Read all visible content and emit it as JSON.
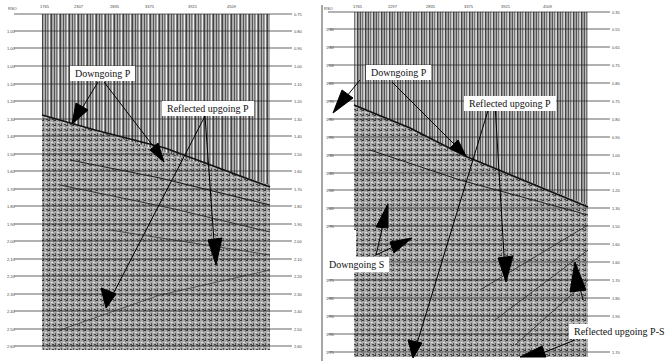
{
  "figure": {
    "panels": [
      {
        "id": "left",
        "axis_label": "RSO",
        "top_ticks": [
          "1765",
          "2307",
          "2835",
          "3375",
          "3921",
          "4509"
        ],
        "left_ticks": [
          "",
          "1.00",
          "1.00",
          "1.00",
          "1.10",
          "1.20",
          "1.30",
          "1.40",
          "1.50",
          "1.60",
          "1.70",
          "1.80",
          "1.90",
          "2.00",
          "2.10",
          "2.20",
          "2.30",
          "2.40",
          "2.50",
          "2.60"
        ],
        "right_ticks": [
          "0.75",
          "0.80",
          "0.90",
          "1.00",
          "1.10",
          "1.20",
          "1.30",
          "1.40",
          "1.50",
          "1.60",
          "1.70",
          "1.80",
          "1.90",
          "2.00",
          "2.10",
          "2.20",
          "2.30",
          "2.40",
          "2.50",
          "2.60"
        ],
        "callouts": [
          {
            "text": "Downgoing P"
          },
          {
            "text": "Reflected upgoing P"
          }
        ]
      },
      {
        "id": "right",
        "axis_label": "RSO",
        "top_ticks": [
          "1765",
          "2297",
          "2835",
          "3375",
          "3921",
          "4509"
        ],
        "left_ticks": [
          "",
          "1.30",
          "1.40",
          "1.50",
          "1.60",
          "1.70",
          "1.80",
          "1.90",
          "1.30",
          "1.40",
          "1.50",
          "1.60",
          "1.70",
          "1.80",
          "",
          "1.75",
          "1.80",
          "1.90",
          "1.90",
          "1.75"
        ],
        "right_ticks": [
          "0.35",
          "0.55",
          "0.65",
          "0.75",
          "0.80",
          "0.75",
          "0.80",
          "0.90",
          "1.00",
          "1.10",
          "1.20",
          "1.30",
          "1.50",
          "1.60",
          "1.60",
          "1.70",
          "1.80",
          "1.90",
          "",
          "1.70"
        ],
        "callouts": [
          {
            "text": "Downgoing P"
          },
          {
            "text": "Reflected upgoing P"
          },
          {
            "text": "Downgoing S"
          },
          {
            "text": "Reflected upgoing P-S"
          }
        ]
      }
    ]
  }
}
